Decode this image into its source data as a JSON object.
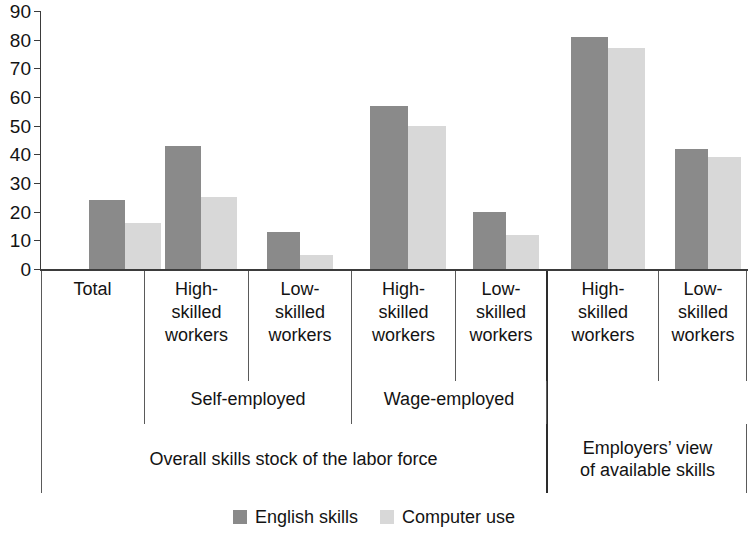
{
  "chart_data": {
    "type": "bar",
    "title": "",
    "subtitle": "",
    "xlabel": "",
    "ylabel": "",
    "ylim": [
      0,
      90
    ],
    "ytick_step": 10,
    "yticks": [
      "90",
      "80",
      "70",
      "60",
      "50",
      "40",
      "30",
      "20",
      "10",
      "0"
    ],
    "grid": false,
    "legend_position": "bottom-center",
    "categories": [
      "Total",
      "High-skilled workers",
      "Low-skilled workers",
      "High-skilled workers",
      "Low-skilled workers",
      "High-skilled workers",
      "Low-skilled workers"
    ],
    "series": [
      {
        "name": "English skills",
        "color": "#8a8a8a",
        "values": [
          24,
          43,
          13,
          57,
          20,
          81,
          42
        ]
      },
      {
        "name": "Computer use",
        "color": "#d8d8d8",
        "values": [
          16,
          25,
          5,
          50,
          12,
          77,
          39
        ]
      }
    ],
    "groups": [
      {
        "label": "",
        "categories": [
          "Total"
        ]
      },
      {
        "label": "Self-employed",
        "categories": [
          "High-skilled workers",
          "Low-skilled workers"
        ]
      },
      {
        "label": "Wage-employed",
        "categories": [
          "High-skilled workers",
          "Low-skilled workers"
        ]
      },
      {
        "label": "",
        "categories": [
          "High-skilled workers",
          "Low-skilled workers"
        ]
      }
    ],
    "sections": [
      {
        "label": "Overall skills stock of the labor force"
      },
      {
        "label": "Employers’ view\nof available skills"
      }
    ],
    "legend": [
      {
        "label": "English skills",
        "color": "#8a8a8a",
        "swatch": "dark-swatch"
      },
      {
        "label": "Computer use",
        "color": "#d8d8d8",
        "swatch": "light-swatch"
      }
    ]
  },
  "axis": {
    "y": {
      "ticks": [
        {
          "value": 90,
          "label": "90"
        },
        {
          "value": 80,
          "label": "80"
        },
        {
          "value": 70,
          "label": "70"
        },
        {
          "value": 60,
          "label": "60"
        },
        {
          "value": 50,
          "label": "50"
        },
        {
          "value": 40,
          "label": "40"
        },
        {
          "value": 30,
          "label": "30"
        },
        {
          "value": 20,
          "label": "20"
        },
        {
          "value": 10,
          "label": "10"
        },
        {
          "value": 0,
          "label": "0"
        }
      ]
    }
  },
  "categories_labels": [
    {
      "line1": "Total",
      "line2": "",
      "line3": ""
    },
    {
      "line1": "High-",
      "line2": "skilled",
      "line3": "workers"
    },
    {
      "line1": "Low-",
      "line2": "skilled",
      "line3": "workers"
    },
    {
      "line1": "High-",
      "line2": "skilled",
      "line3": "workers"
    },
    {
      "line1": "Low-",
      "line2": "skilled",
      "line3": "workers"
    },
    {
      "line1": "High-",
      "line2": "skilled",
      "line3": "workers"
    },
    {
      "line1": "Low-",
      "line2": "skilled",
      "line3": "workers"
    }
  ],
  "group_labels": {
    "self_employed": "Self-employed",
    "wage_employed": "Wage-employed"
  },
  "section_labels": {
    "overall": "Overall skills stock of the labor force",
    "employers_line1": "Employers’ view",
    "employers_line2": "of available skills"
  },
  "legend_labels": {
    "english": "English skills",
    "computer": "Computer use"
  },
  "colors": {
    "series_dark": "#8a8a8a",
    "series_light": "#d8d8d8",
    "axis": "#3b3b3b",
    "text": "#131313"
  }
}
